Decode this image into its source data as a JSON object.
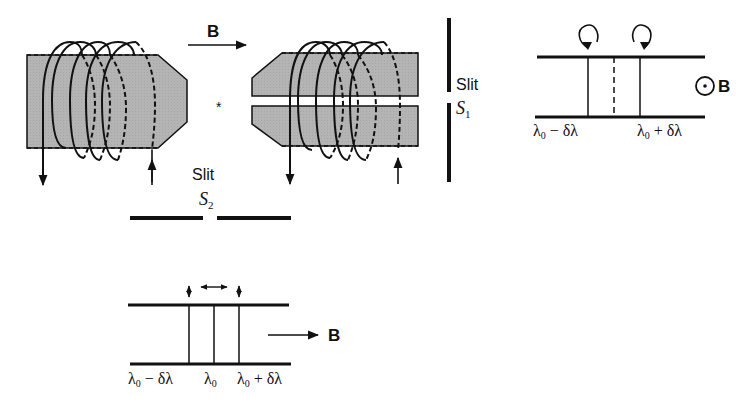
{
  "diagram": {
    "colors": {
      "ink": "#111111",
      "pole_fill": "#b4b4b4",
      "background": "#ffffff"
    },
    "apparatus": {
      "field_label": "B",
      "field_direction": "left-to-right",
      "source_marker": "*",
      "left_pole": {
        "name": "left-pole-piece",
        "coil_turns": 4
      },
      "right_pole": {
        "name": "right-pole-piece",
        "coil_turns": 4,
        "has_axial_bore": true
      },
      "slit1": {
        "word": "Slit",
        "symbol": "S",
        "subscript": "1",
        "orientation": "vertical"
      },
      "slit2": {
        "word": "Slit",
        "symbol": "S",
        "subscript": "2",
        "orientation": "horizontal"
      }
    },
    "transverse_view": {
      "field_label": "B",
      "field_symbol": "arrow-right",
      "lines": [
        {
          "label": "λ₀ − δλ",
          "main": "λ",
          "sub": "0",
          "rest": " − δλ",
          "style": "solid",
          "polarization": "vertical"
        },
        {
          "label": "λ₀",
          "main": "λ",
          "sub": "0",
          "rest": "",
          "style": "solid",
          "polarization": "horizontal"
        },
        {
          "label": "λ₀ + δλ",
          "main": "λ",
          "sub": "0",
          "rest": " + δλ",
          "style": "solid",
          "polarization": "vertical"
        }
      ]
    },
    "longitudinal_view": {
      "field_label": "B",
      "field_symbol": "dot-in-circle (out of page)",
      "lines": [
        {
          "label": "λ₀ − δλ",
          "main": "λ",
          "sub": "0",
          "rest": " − δλ",
          "style": "solid",
          "polarization": "circular-counterclockwise"
        },
        {
          "label": "λ₀",
          "style": "dashed (absent)",
          "polarization": "none"
        },
        {
          "label": "λ₀ + δλ",
          "main": "λ",
          "sub": "0",
          "rest": " + δλ",
          "style": "solid",
          "polarization": "circular-clockwise"
        }
      ]
    }
  }
}
